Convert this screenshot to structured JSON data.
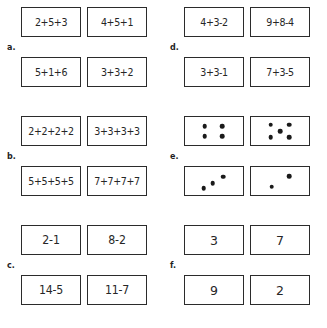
{
  "document": {
    "type": "math-worksheet",
    "columns": 2,
    "rows": 3
  },
  "groups": [
    {
      "label": "a.",
      "kind": "text",
      "cells": [
        {
          "text": "2+5+3",
          "size": "long"
        },
        {
          "text": "4+5+1",
          "size": "long"
        },
        {
          "text": "5+1+6",
          "size": "long"
        },
        {
          "text": "3+3+2",
          "size": "long"
        }
      ]
    },
    {
      "label": "d.",
      "kind": "text",
      "cells": [
        {
          "text": "4+3-2",
          "size": "long"
        },
        {
          "text": "9+8-4",
          "size": "long"
        },
        {
          "text": "3+3-1",
          "size": "long"
        },
        {
          "text": "7+3-5",
          "size": "long"
        }
      ]
    },
    {
      "label": "b.",
      "kind": "text",
      "cells": [
        {
          "text": "2+2+2+2",
          "size": "long"
        },
        {
          "text": "3+3+3+3",
          "size": "long"
        },
        {
          "text": "5+5+5+5",
          "size": "long"
        },
        {
          "text": "7+7+7+7",
          "size": "long"
        }
      ]
    },
    {
      "label": "e.",
      "kind": "dots",
      "cells": [
        {
          "count": 4,
          "dots": [
            [
              34,
              32
            ],
            [
              64,
              32
            ],
            [
              34,
              68
            ],
            [
              64,
              68
            ]
          ]
        },
        {
          "count": 5,
          "dots": [
            [
              34,
              28
            ],
            [
              66,
              28
            ],
            [
              50,
              50
            ],
            [
              34,
              72
            ],
            [
              66,
              72
            ]
          ]
        },
        {
          "count": 3,
          "dots": [
            [
              32,
              76
            ],
            [
              48,
              58
            ],
            [
              66,
              34
            ]
          ]
        },
        {
          "count": 2,
          "dots": [
            [
              36,
              70
            ],
            [
              66,
              32
            ]
          ]
        }
      ]
    },
    {
      "label": "c.",
      "kind": "text",
      "cells": [
        {
          "text": "2-1",
          "size": "normal"
        },
        {
          "text": "8-2",
          "size": "normal"
        },
        {
          "text": "14-5",
          "size": "normal"
        },
        {
          "text": "11-7",
          "size": "normal"
        }
      ]
    },
    {
      "label": "f.",
      "kind": "text",
      "cells": [
        {
          "text": "3",
          "size": "single"
        },
        {
          "text": "7",
          "size": "single"
        },
        {
          "text": "9",
          "size": "single"
        },
        {
          "text": "2",
          "size": "single"
        }
      ]
    }
  ]
}
